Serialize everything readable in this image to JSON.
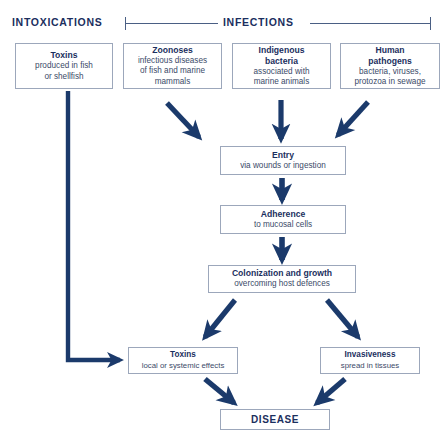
{
  "diagram": {
    "title_visible": false,
    "accent_color": "#1b3a6b",
    "box_border_color": "#9ca7bb",
    "text_color": "#1b2f5e",
    "headers": {
      "intoxications": "INTOXICATIONS",
      "infections": "INFECTIONS"
    },
    "top_row": [
      {
        "name": "toxins-source",
        "title": "Toxins",
        "subtitle": "produced in fish or shellfish",
        "subtitle_lines": [
          "produced in fish",
          "or shellfish"
        ],
        "category": "INTOXICATIONS"
      },
      {
        "name": "zoonoses",
        "title": "Zoonoses",
        "subtitle": "infectious diseases of fish and marine mammals",
        "subtitle_lines": [
          "infectious diseases",
          "of fish and marine",
          "mammals"
        ],
        "category": "INFECTIONS"
      },
      {
        "name": "indigenous-bacteria",
        "title": "Indigenous bacteria",
        "title_lines": [
          "Indigenous",
          "bacteria"
        ],
        "subtitle": "associated with marine animals",
        "subtitle_lines": [
          "associated with",
          "marine animals"
        ],
        "category": "INFECTIONS"
      },
      {
        "name": "human-pathogens",
        "title": "Human pathogens",
        "title_lines": [
          "Human",
          "pathogens"
        ],
        "subtitle": "bacteria, viruses, protozoa in sewage",
        "subtitle_lines": [
          "bacteria, viruses,",
          "protozoa in sewage"
        ],
        "category": "INFECTIONS"
      }
    ],
    "chain": [
      {
        "name": "entry",
        "title": "Entry",
        "subtitle": "via wounds or ingestion"
      },
      {
        "name": "adherence",
        "title": "Adherence",
        "subtitle": "to mucosal cells"
      },
      {
        "name": "colonization",
        "title": "Colonization and growth",
        "subtitle": "overcoming host defences"
      }
    ],
    "outcomes": [
      {
        "name": "toxins-effect",
        "title": "Toxins",
        "subtitle": "local or systemic effects"
      },
      {
        "name": "invasiveness",
        "title": "Invasiveness",
        "subtitle": "spread in tissues"
      }
    ],
    "terminal": {
      "name": "disease",
      "title": "DISEASE"
    },
    "arrows": [
      {
        "name": "zoonoses-to-entry",
        "from": "zoonoses",
        "to": "entry",
        "style": "diagonal-down-right"
      },
      {
        "name": "indigenous-to-entry",
        "from": "indigenous-bacteria",
        "to": "entry",
        "style": "straight-down"
      },
      {
        "name": "human-pathogens-to-entry",
        "from": "human-pathogens",
        "to": "entry",
        "style": "diagonal-down-left"
      },
      {
        "name": "entry-to-adherence",
        "from": "entry",
        "to": "adherence",
        "style": "straight-down"
      },
      {
        "name": "adherence-to-colonization",
        "from": "adherence",
        "to": "colonization",
        "style": "straight-down"
      },
      {
        "name": "colonization-to-toxins",
        "from": "colonization",
        "to": "toxins-effect",
        "style": "diagonal-down-left"
      },
      {
        "name": "colonization-to-invasiveness",
        "from": "colonization",
        "to": "invasiveness",
        "style": "diagonal-down-right"
      },
      {
        "name": "toxins-source-to-toxins-effect",
        "from": "toxins-source",
        "to": "toxins-effect",
        "style": "elbow-down-right"
      },
      {
        "name": "toxins-to-disease",
        "from": "toxins-effect",
        "to": "disease",
        "style": "diagonal-down-right"
      },
      {
        "name": "invasiveness-to-disease",
        "from": "invasiveness",
        "to": "disease",
        "style": "diagonal-down-left"
      }
    ]
  }
}
